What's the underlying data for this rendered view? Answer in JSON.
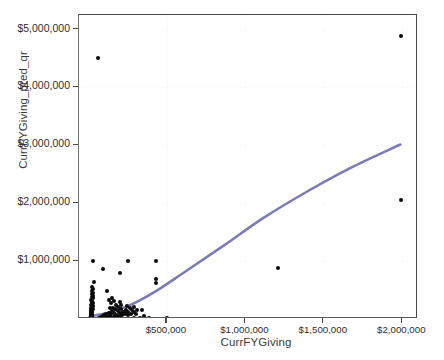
{
  "chart_data": {
    "type": "scatter",
    "title": "",
    "xlabel": "CurrFYGiving",
    "ylabel": "CurrFYGiving_pred_qr",
    "xlim": [
      -60000,
      2100000
    ],
    "ylim": [
      0,
      5250000
    ],
    "grid": true,
    "legend": null,
    "x_ticks": [
      {
        "value": 500000,
        "label": "$500,000"
      },
      {
        "value": 1000000,
        "label": "$1,000,000"
      },
      {
        "value": 1500000,
        "label": "$1,500,000"
      },
      {
        "value": 2000000,
        "label": "$2,000,000"
      }
    ],
    "y_ticks": [
      {
        "value": 5000000,
        "label": "$5,000,000"
      },
      {
        "value": 4000000,
        "label": "$4,000,000"
      },
      {
        "value": 3000000,
        "label": "$3,000,000"
      },
      {
        "value": 2000000,
        "label": "$2,000,000"
      },
      {
        "value": 1000000,
        "label": "$1,000,000"
      }
    ],
    "marker": {
      "color": "#0a0a0a",
      "shape": "circle",
      "size_px": 4
    },
    "fit_line": {
      "name": "quantile regression fit",
      "color": "#7b7bb5",
      "width_px": 2.6,
      "points": [
        [
          20000,
          20000
        ],
        [
          120000,
          75000
        ],
        [
          260000,
          200000
        ],
        [
          420000,
          430000
        ],
        [
          620000,
          790000
        ],
        [
          860000,
          1230000
        ],
        [
          1120000,
          1720000
        ],
        [
          1400000,
          2180000
        ],
        [
          1700000,
          2620000
        ],
        [
          2000000,
          3000000
        ]
      ]
    },
    "points": [
      [
        60000,
        4500000
      ],
      [
        1990000,
        4890000
      ],
      [
        1990000,
        2050000
      ],
      [
        30000,
        1000000
      ],
      [
        250000,
        1010000
      ],
      [
        430000,
        1010000
      ],
      [
        1210000,
        880000
      ],
      [
        90000,
        860000
      ],
      [
        200000,
        790000
      ],
      [
        430000,
        700000
      ],
      [
        430000,
        630000
      ],
      [
        35000,
        640000
      ],
      [
        25000,
        560000
      ],
      [
        30000,
        520000
      ],
      [
        20000,
        490000
      ],
      [
        28000,
        455000
      ],
      [
        22000,
        430000
      ],
      [
        30000,
        405000
      ],
      [
        20000,
        380000
      ],
      [
        26000,
        355000
      ],
      [
        18000,
        335000
      ],
      [
        24000,
        315000
      ],
      [
        20000,
        295000
      ],
      [
        28000,
        278000
      ],
      [
        22000,
        262000
      ],
      [
        18000,
        246000
      ],
      [
        26000,
        232000
      ],
      [
        20000,
        218000
      ],
      [
        24000,
        205000
      ],
      [
        18000,
        193000
      ],
      [
        22000,
        181000
      ],
      [
        26000,
        170000
      ],
      [
        19000,
        160000
      ],
      [
        23000,
        150000
      ],
      [
        17000,
        141000
      ],
      [
        21000,
        132000
      ],
      [
        25000,
        124000
      ],
      [
        18000,
        116000
      ],
      [
        22000,
        109000
      ],
      [
        16000,
        102000
      ],
      [
        20000,
        95000
      ],
      [
        24000,
        89000
      ],
      [
        17000,
        83000
      ],
      [
        21000,
        77000
      ],
      [
        15000,
        72000
      ],
      [
        19000,
        67000
      ],
      [
        23000,
        62000
      ],
      [
        16000,
        57000
      ],
      [
        20000,
        53000
      ],
      [
        14000,
        49000
      ],
      [
        18000,
        45000
      ],
      [
        22000,
        41000
      ],
      [
        15000,
        38000
      ],
      [
        19000,
        34000
      ],
      [
        13000,
        31000
      ],
      [
        17000,
        28000
      ],
      [
        21000,
        25000
      ],
      [
        14000,
        23000
      ],
      [
        18000,
        20000
      ],
      [
        12000,
        18000
      ],
      [
        16000,
        16000
      ],
      [
        20000,
        14000
      ],
      [
        13000,
        12000
      ],
      [
        17000,
        10000
      ],
      [
        11000,
        9000
      ],
      [
        15000,
        7000
      ],
      [
        19000,
        6000
      ],
      [
        23000,
        5000
      ],
      [
        27000,
        4000
      ],
      [
        31000,
        3500
      ],
      [
        10000,
        5000
      ],
      [
        14000,
        3000
      ],
      [
        18000,
        2500
      ],
      [
        120000,
        480000
      ],
      [
        150000,
        370000
      ],
      [
        130000,
        330000
      ],
      [
        165000,
        310000
      ],
      [
        200000,
        300000
      ],
      [
        145000,
        275000
      ],
      [
        175000,
        250000
      ],
      [
        210000,
        235000
      ],
      [
        245000,
        225000
      ],
      [
        190000,
        205000
      ],
      [
        155000,
        195000
      ],
      [
        135000,
        185000
      ],
      [
        170000,
        175000
      ],
      [
        205000,
        168000
      ],
      [
        240000,
        160000
      ],
      [
        275000,
        152000
      ],
      [
        310000,
        158000
      ],
      [
        150000,
        145000
      ],
      [
        185000,
        138000
      ],
      [
        220000,
        130000
      ],
      [
        255000,
        124000
      ],
      [
        290000,
        118000
      ],
      [
        130000,
        112000
      ],
      [
        165000,
        106000
      ],
      [
        200000,
        100000
      ],
      [
        235000,
        95000
      ],
      [
        270000,
        90000
      ],
      [
        110000,
        85000
      ],
      [
        145000,
        80000
      ],
      [
        180000,
        76000
      ],
      [
        215000,
        72000
      ],
      [
        250000,
        68000
      ],
      [
        100000,
        62000
      ],
      [
        135000,
        58000
      ],
      [
        170000,
        54000
      ],
      [
        205000,
        50000
      ],
      [
        90000,
        45000
      ],
      [
        125000,
        42000
      ],
      [
        160000,
        38000
      ],
      [
        195000,
        35000
      ],
      [
        80000,
        31000
      ],
      [
        115000,
        28000
      ],
      [
        150000,
        25000
      ],
      [
        185000,
        22000
      ],
      [
        70000,
        19000
      ],
      [
        105000,
        16000
      ],
      [
        140000,
        14000
      ],
      [
        175000,
        11000
      ],
      [
        60000,
        9000
      ],
      [
        95000,
        7000
      ],
      [
        130000,
        5500
      ],
      [
        165000,
        4500
      ],
      [
        50000,
        4000
      ],
      [
        85000,
        3000
      ],
      [
        120000,
        2500
      ],
      [
        155000,
        2000
      ],
      [
        40000,
        2000
      ],
      [
        75000,
        1500
      ],
      [
        210000,
        8000
      ],
      [
        245000,
        6000
      ],
      [
        290000,
        12000
      ],
      [
        330000,
        10000
      ],
      [
        385000,
        14000
      ],
      [
        500000,
        20000
      ],
      [
        355000,
        55000
      ],
      [
        300000,
        90000
      ],
      [
        265000,
        185000
      ],
      [
        230000,
        130000
      ],
      [
        290000,
        210000
      ],
      [
        340000,
        150000
      ]
    ]
  }
}
